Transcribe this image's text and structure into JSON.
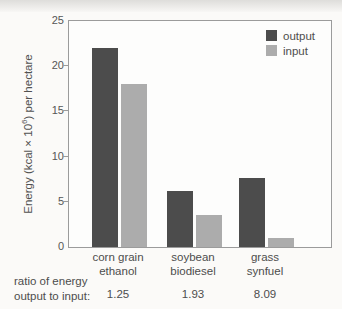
{
  "figure": {
    "background": "#fbfaf8",
    "y_axis_label": {
      "prefix": "Energy (kcal × 10",
      "sup": "6",
      "suffix": ") per hectare"
    }
  },
  "chart_data": {
    "type": "bar",
    "title": "",
    "xlabel": "",
    "ylabel": "Energy (kcal × 10^6) per hectare",
    "ylim": [
      0,
      25
    ],
    "yticks": [
      0,
      5,
      10,
      15,
      20,
      25
    ],
    "grid": false,
    "legend_position": "top-right-inside",
    "categories": [
      {
        "line1": "corn grain",
        "line2": "ethanol"
      },
      {
        "line1": "soybean",
        "line2": "biodiesel"
      },
      {
        "line1": "grass",
        "line2": "synfuel"
      }
    ],
    "series": [
      {
        "name": "output",
        "color": "#4c4c4c",
        "values": [
          22,
          6.2,
          7.6
        ]
      },
      {
        "name": "input",
        "color": "#acacac",
        "values": [
          18,
          3.5,
          1.0
        ]
      }
    ],
    "ratio": {
      "label_line1": "ratio of energy",
      "label_line2": "output to input:",
      "values": [
        "1.25",
        "1.93",
        "8.09"
      ]
    }
  }
}
